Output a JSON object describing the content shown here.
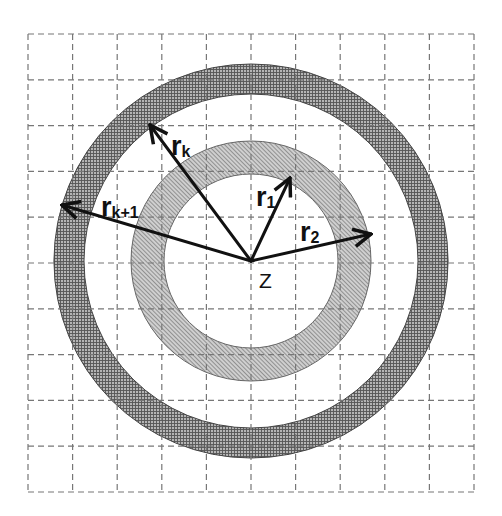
{
  "diagram": {
    "title": "",
    "center": {
      "x": 251,
      "y": 261,
      "label": "Z"
    },
    "grid": {
      "x0": 28,
      "y0": 34,
      "x1": 474,
      "y1": 492,
      "columns": 10,
      "rows": 10,
      "style": "dashed",
      "color": "#777777"
    },
    "rings": [
      {
        "name": "inner-ring",
        "inner_radius": 87,
        "outer_radius": 120,
        "fill": "#bdbdbd",
        "pattern": "diagonal-hatch"
      },
      {
        "name": "outer-ring",
        "inner_radius": 167,
        "outer_radius": 197,
        "fill": "#9a9a9a",
        "pattern": "crosshatch"
      }
    ],
    "vectors": [
      {
        "name": "r1",
        "label": "r",
        "subscript": "1",
        "tip": {
          "x": 290,
          "y": 178
        }
      },
      {
        "name": "r2",
        "label": "r",
        "subscript": "2",
        "tip": {
          "x": 371,
          "y": 234
        }
      },
      {
        "name": "rk",
        "label": "r",
        "subscript": "k",
        "tip": {
          "x": 150,
          "y": 125
        }
      },
      {
        "name": "rk1",
        "label": "r",
        "subscript": "k+1",
        "tip": {
          "x": 62,
          "y": 205
        }
      }
    ],
    "labels": {
      "r1_main": "r",
      "r1_sub": "1",
      "r2_main": "r",
      "r2_sub": "2",
      "rk_main": "r",
      "rk_sub": "k",
      "rk1_main": "r",
      "rk1_sub": "k+1",
      "center": "Z"
    }
  }
}
